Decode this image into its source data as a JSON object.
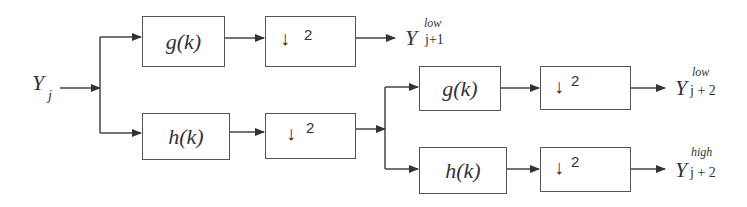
{
  "diagram": {
    "input": {
      "symbol": "Y",
      "subscript": "j"
    },
    "blocks": {
      "g1": {
        "label": "g(k)"
      },
      "h1": {
        "label": "h(k)"
      },
      "ds1": {
        "arrow": "↓",
        "factor": "2"
      },
      "ds2": {
        "arrow": "↓",
        "factor": "2"
      },
      "g2": {
        "label": "g(k)"
      },
      "h2": {
        "label": "h(k)"
      },
      "ds3": {
        "arrow": "↓",
        "factor": "2"
      },
      "ds4": {
        "arrow": "↓",
        "factor": "2"
      }
    },
    "outputs": {
      "out1": {
        "symbol": "Y",
        "superscript": "low",
        "subscript": "j+1"
      },
      "out2": {
        "symbol": "Y",
        "superscript": "low",
        "subscript": "j + 2"
      },
      "out3": {
        "symbol": "Y",
        "superscript": "high",
        "subscript": "j + 2"
      }
    },
    "colors": {
      "line": "#444444",
      "box_border": "#555555",
      "text": "#333333"
    }
  }
}
